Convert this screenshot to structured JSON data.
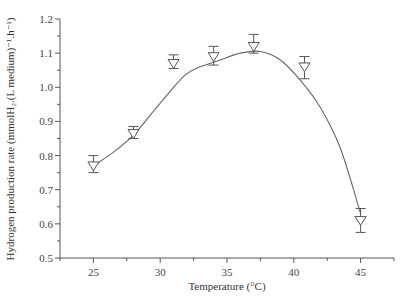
{
  "chart_data": {
    "type": "scatter",
    "title": "",
    "xlabel": "Temperature (°C)",
    "ylabel": "Hydrogen production rate (mmolH₂.(L medium)⁻¹.h⁻¹)",
    "xlim": [
      22.5,
      47.5
    ],
    "ylim": [
      0.5,
      1.2
    ],
    "x_ticks": [
      25,
      30,
      35,
      40,
      45
    ],
    "x_tick_labels": [
      "25",
      "30",
      "35",
      "40",
      "45"
    ],
    "y_ticks": [
      0.5,
      0.6,
      0.7,
      0.8,
      0.9,
      1.0,
      1.1,
      1.2
    ],
    "y_tick_labels": [
      "0.5",
      "0.6",
      "0.7",
      "0.8",
      "0.9",
      "1.0",
      "1.1",
      "1.2"
    ],
    "grid": false,
    "legend": null,
    "marker": "open inverted triangle",
    "fit_curve": "smooth curve through points",
    "series": [
      {
        "name": "Hydrogen production rate",
        "x": [
          25,
          28,
          31,
          34,
          37,
          40.8,
          45
        ],
        "y": [
          0.77,
          0.865,
          1.07,
          1.09,
          1.12,
          1.06,
          0.61
        ],
        "err_low": [
          0.75,
          0.85,
          1.055,
          1.065,
          1.1,
          1.025,
          0.575
        ],
        "err_high": [
          0.8,
          0.885,
          1.095,
          1.12,
          1.155,
          1.09,
          0.645
        ]
      }
    ]
  }
}
